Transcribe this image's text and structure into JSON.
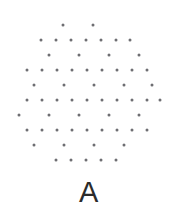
{
  "figure": {
    "label": "A",
    "dot_color": "#6e6e72",
    "background_color": "#ffffff",
    "dot_diameter_px": 3,
    "width_px": 178,
    "height_px": 219
  },
  "chart_data": {
    "type": "scatter",
    "title": "A",
    "xlabel": "",
    "ylabel": "",
    "xlim": [
      0,
      178
    ],
    "ylim": [
      0,
      170
    ],
    "grid": false,
    "legend": null,
    "marker_color": "#6e6e72",
    "marker_size_px": 3,
    "row_count": 10,
    "point_count": 60,
    "rows": [
      {
        "y": 25,
        "spacing": 30,
        "x": [
          63,
          93
        ]
      },
      {
        "y": 40,
        "spacing": 15,
        "x": [
          41,
          56,
          71,
          86,
          101,
          116,
          130
        ]
      },
      {
        "y": 55,
        "spacing": 30,
        "x": [
          49,
          79,
          109,
          139
        ]
      },
      {
        "y": 70,
        "spacing": 15,
        "x": [
          27,
          42,
          57,
          72,
          87,
          102,
          117,
          132,
          147
        ]
      },
      {
        "y": 85,
        "spacing": 30,
        "x": [
          34,
          64,
          94,
          124,
          152
        ]
      },
      {
        "y": 100,
        "spacing": 15,
        "x": [
          27,
          42,
          57,
          72,
          87,
          102,
          117,
          132,
          147,
          160
        ]
      },
      {
        "y": 115,
        "spacing": 30,
        "x": [
          19,
          49,
          79,
          109,
          139
        ]
      },
      {
        "y": 130,
        "spacing": 15,
        "x": [
          27,
          42,
          57,
          72,
          87,
          102,
          117,
          132,
          147
        ]
      },
      {
        "y": 145,
        "spacing": 30,
        "x": [
          34,
          64,
          94,
          124
        ]
      },
      {
        "y": 160,
        "spacing": 15,
        "x": [
          56,
          71,
          86,
          101,
          116
        ]
      }
    ],
    "points_x": [
      63,
      93,
      41,
      56,
      71,
      86,
      101,
      116,
      130,
      49,
      79,
      109,
      139,
      27,
      42,
      57,
      72,
      87,
      102,
      117,
      132,
      147,
      34,
      64,
      94,
      124,
      152,
      27,
      42,
      57,
      72,
      87,
      102,
      117,
      132,
      147,
      160,
      19,
      49,
      79,
      109,
      139,
      27,
      42,
      57,
      72,
      87,
      102,
      117,
      132,
      147,
      34,
      64,
      94,
      124,
      56,
      71,
      86,
      101,
      116
    ],
    "points_y": [
      25,
      25,
      40,
      40,
      40,
      40,
      40,
      40,
      40,
      55,
      55,
      55,
      55,
      70,
      70,
      70,
      70,
      70,
      70,
      70,
      70,
      70,
      85,
      85,
      85,
      85,
      85,
      100,
      100,
      100,
      100,
      100,
      100,
      100,
      100,
      100,
      100,
      115,
      115,
      115,
      115,
      115,
      130,
      130,
      130,
      130,
      130,
      130,
      130,
      130,
      130,
      145,
      145,
      145,
      145,
      160,
      160,
      160,
      160,
      160
    ]
  }
}
